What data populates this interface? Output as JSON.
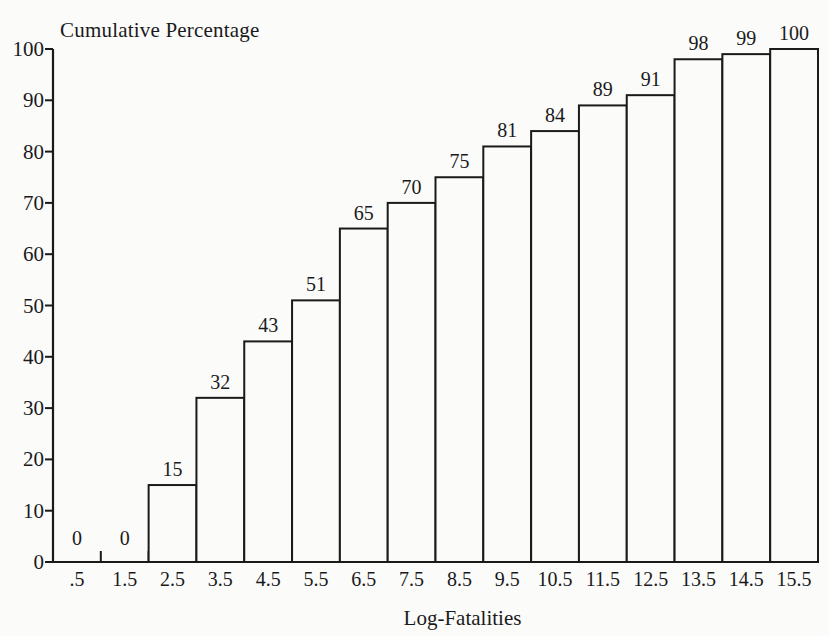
{
  "chart_data": {
    "type": "bar",
    "title": "",
    "ylabel": "Cumulative Percentage",
    "xlabel": "Log-Fatalities",
    "categories": [
      ".5",
      "1.5",
      "2.5",
      "3.5",
      "4.5",
      "5.5",
      "6.5",
      "7.5",
      "8.5",
      "9.5",
      "10.5",
      "11.5",
      "12.5",
      "13.5",
      "14.5",
      "15.5"
    ],
    "values": [
      0,
      0,
      15,
      32,
      43,
      51,
      65,
      70,
      75,
      81,
      84,
      89,
      91,
      98,
      99,
      100
    ],
    "value_labels": [
      "0",
      "0",
      "15",
      "32",
      "43",
      "51",
      "65",
      "70",
      "75",
      "81",
      "84",
      "89",
      "91",
      "98",
      "99",
      "100"
    ],
    "ylim": [
      0,
      100
    ],
    "yticks": [
      0,
      10,
      20,
      30,
      40,
      50,
      60,
      70,
      80,
      90,
      100
    ],
    "ytick_labels": [
      "0",
      "10",
      "20",
      "30",
      "40",
      "50",
      "60",
      "70",
      "80",
      "90",
      "100"
    ],
    "grid": false,
    "legend": "none",
    "bar_fill": "#fbfbfa",
    "bar_edge": "#1a1a1a",
    "axis_color": "#1a1a1a"
  }
}
